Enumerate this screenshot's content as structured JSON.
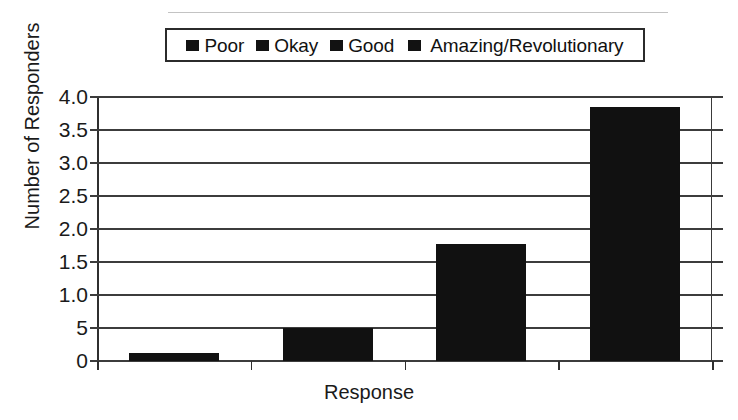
{
  "chart_data": {
    "type": "bar",
    "title": "",
    "xlabel": "Response",
    "ylabel": "Number of Responders",
    "categories": [
      "Poor",
      "Okay",
      "Good",
      "Amazing/Revolutionary"
    ],
    "values": [
      0.12,
      0.5,
      1.78,
      3.85
    ],
    "ylim": [
      0,
      4.0
    ],
    "ytick_values": [
      4.0,
      3.5,
      3.0,
      2.5,
      2.0,
      1.5,
      1.0,
      0.5,
      0
    ],
    "ytick_labels": [
      "4.0",
      "3.5",
      "3.0",
      "2.5",
      "2.0",
      "1.5",
      "1.0",
      "5",
      "0"
    ],
    "grid": true,
    "legend_position": "top-center",
    "series": [
      {
        "name": "Number of Responders",
        "values": [
          0.12,
          0.5,
          1.78,
          3.85
        ],
        "color": "#111111"
      }
    ],
    "bar_color": "#111111",
    "axis_color": "#2f2f2f"
  },
  "legend": {
    "items": [
      {
        "label": "Poor",
        "swatch_color": "#121212"
      },
      {
        "label": "Okay",
        "swatch_color": "#121212"
      },
      {
        "label": "Good",
        "swatch_color": "#121212"
      },
      {
        "label": "Amazing/Revolutionary",
        "swatch_color": "#121212"
      }
    ]
  },
  "axes": {
    "y_title": "Number of Responders",
    "x_title": "Response"
  }
}
